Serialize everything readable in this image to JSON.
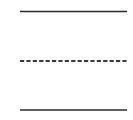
{
  "diagram": {
    "background": "#ffffff",
    "lines": [
      {
        "name": "top-solid-line",
        "style": "solid",
        "x1": 20,
        "x2": 127,
        "y": 11.5,
        "stroke": "#2a2a2a",
        "width": 1.6
      },
      {
        "name": "middle-dashed-line",
        "style": "dashed",
        "x1": 20,
        "x2": 127,
        "y": 61,
        "stroke": "#3a3a3a",
        "width": 1.8,
        "dash": "4.2,2.2"
      },
      {
        "name": "bottom-solid-line",
        "style": "solid",
        "x1": 20,
        "x2": 127,
        "y": 110,
        "stroke": "#2a2a2a",
        "width": 1.6
      }
    ]
  }
}
